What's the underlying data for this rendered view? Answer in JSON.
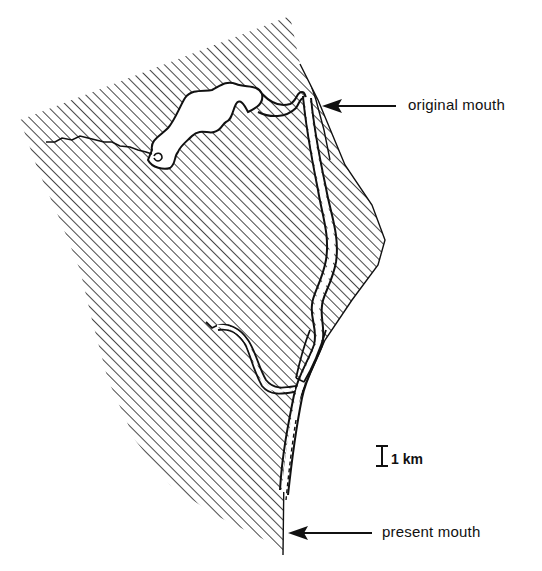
{
  "figure": {
    "type": "river-mouth migration map",
    "colors": {
      "ink": "#111111",
      "background": "#ffffff",
      "hatch": "#1a1a1a"
    },
    "legend_pattern": "diagonal-hatch land area"
  },
  "annotations": {
    "original_mouth": "original mouth",
    "present_mouth": "present mouth"
  },
  "scale_bar": {
    "label": "1 km"
  }
}
